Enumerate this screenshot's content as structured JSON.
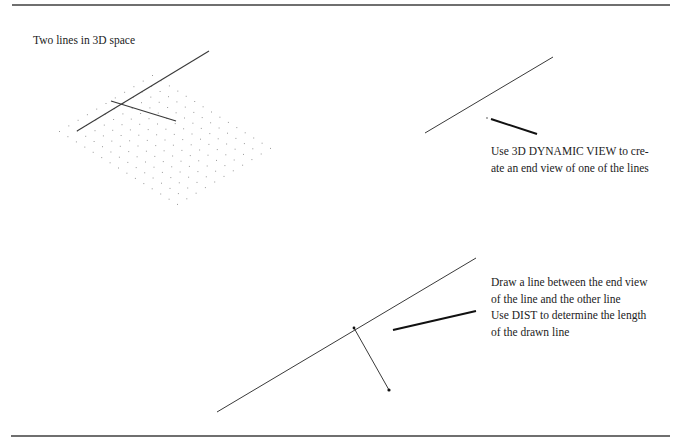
{
  "figure": {
    "title": "Two lines in 3D space",
    "step2_text": [
      "Use 3D DYNAMIC VIEW to cre-",
      "ate an end view of one of the lines"
    ],
    "step3_text": [
      "Draw a line between the end view",
      "of the line and the other line",
      "Use DIST to determine the length",
      "of the drawn line"
    ]
  },
  "colors": {
    "rule": "#6f6f6f",
    "line": "#3a3a3a",
    "leader": "#111111",
    "dot": "#9a9a9a"
  },
  "panels": {
    "isometric": {
      "line_a": [
        77,
        131,
        209,
        51
      ],
      "line_b": [
        111,
        101,
        176,
        121
      ],
      "grid": {
        "origin": [
          59,
          131
        ],
        "u": [
          9.3,
          -5.6
        ],
        "v": [
          8.43,
          5.21
        ],
        "nu": 10,
        "nv": 14
      }
    },
    "end_view": {
      "line": [
        425,
        133,
        553,
        57
      ],
      "point": [
        487,
        118
      ],
      "leader": [
        491,
        119,
        537,
        134
      ]
    },
    "distance": {
      "line": [
        217,
        412,
        476,
        258
      ],
      "perpendicular": [
        354,
        328,
        389,
        390
      ],
      "leader": [
        393,
        330,
        476,
        311
      ]
    }
  }
}
